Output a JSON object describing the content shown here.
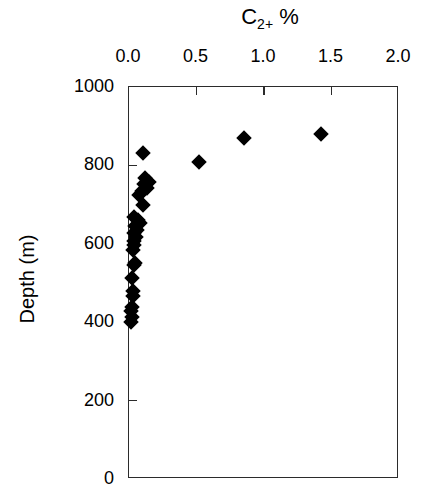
{
  "chart_data": {
    "type": "scatter",
    "title": "C2+ %",
    "title_base": "C",
    "title_sub": "2+",
    "title_unit": "%",
    "xlabel": "C2+ %",
    "ylabel": "Depth (m)",
    "xlim": [
      0.0,
      2.0
    ],
    "ylim": [
      1000,
      0
    ],
    "y_inverted": true,
    "grid": false,
    "legend": null,
    "xticks": [
      0.0,
      0.5,
      1.0,
      1.5,
      2.0
    ],
    "xtick_labels": [
      "0.0",
      "0.5",
      "1.0",
      "1.5",
      "2.0"
    ],
    "yticks": [
      0,
      200,
      400,
      600,
      800,
      1000
    ],
    "ytick_labels": [
      "0",
      "200",
      "400",
      "600",
      "800",
      "1000"
    ],
    "marker": "filled-diamond",
    "marker_color": "#000000",
    "axis_color": "#2b2b2b",
    "points": [
      {
        "x": 0.015,
        "y": 400
      },
      {
        "x": 0.02,
        "y": 412
      },
      {
        "x": 0.018,
        "y": 428
      },
      {
        "x": 0.022,
        "y": 440
      },
      {
        "x": 0.03,
        "y": 468
      },
      {
        "x": 0.028,
        "y": 480
      },
      {
        "x": 0.02,
        "y": 512
      },
      {
        "x": 0.035,
        "y": 545
      },
      {
        "x": 0.048,
        "y": 552
      },
      {
        "x": 0.03,
        "y": 585
      },
      {
        "x": 0.035,
        "y": 597
      },
      {
        "x": 0.04,
        "y": 608
      },
      {
        "x": 0.055,
        "y": 618
      },
      {
        "x": 0.038,
        "y": 628
      },
      {
        "x": 0.06,
        "y": 635
      },
      {
        "x": 0.048,
        "y": 645
      },
      {
        "x": 0.085,
        "y": 652
      },
      {
        "x": 0.07,
        "y": 660
      },
      {
        "x": 0.04,
        "y": 668
      },
      {
        "x": 0.1,
        "y": 700
      },
      {
        "x": 0.075,
        "y": 725
      },
      {
        "x": 0.095,
        "y": 735
      },
      {
        "x": 0.13,
        "y": 742
      },
      {
        "x": 0.11,
        "y": 752
      },
      {
        "x": 0.15,
        "y": 758
      },
      {
        "x": 0.12,
        "y": 768
      },
      {
        "x": 0.105,
        "y": 832
      },
      {
        "x": 0.515,
        "y": 808
      },
      {
        "x": 0.855,
        "y": 870
      },
      {
        "x": 1.42,
        "y": 880
      }
    ]
  }
}
